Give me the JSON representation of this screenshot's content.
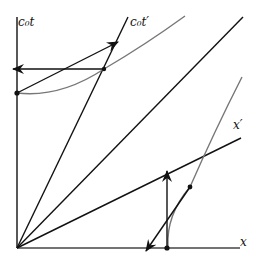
{
  "diagram": {
    "type": "spacetime-minkowski-diagram",
    "labels": {
      "ct_axis": "c₀t",
      "ct_prime_axis": "c₀t′",
      "x_axis": "x",
      "x_prime_axis": "x′"
    },
    "colors": {
      "axes": "#111111",
      "hyperbola": "#777777",
      "background": "#ffffff"
    },
    "elements": [
      "ct-axis",
      "x-axis",
      "ct-prime-axis",
      "light-cone-line",
      "x-prime-axis",
      "upper-hyperbola",
      "lower-hyperbola",
      "horizontal-arrow-left",
      "diagonal-arrow-up-right",
      "vertical-arrow-up",
      "diagonal-arrow-down-left",
      "event-dots"
    ]
  }
}
